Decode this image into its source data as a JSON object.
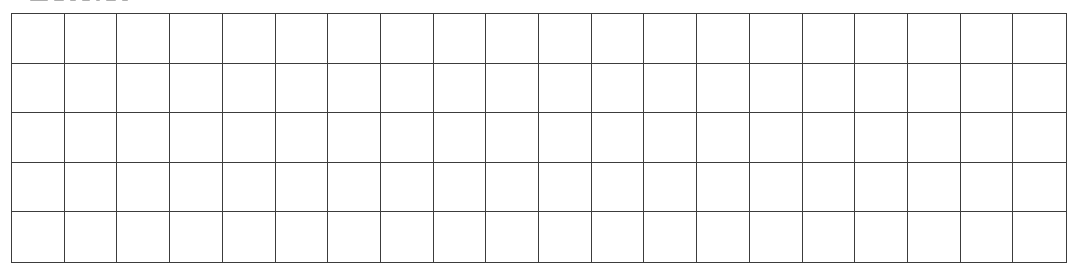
{
  "heading": {
    "text": "",
    "clipped": true,
    "visible_fragment_widths": [
      18,
      10,
      6,
      8,
      4,
      10,
      6
    ]
  },
  "grid": {
    "rows": 5,
    "columns": 20,
    "line_color": "#3c3c3c",
    "background": "#ffffff",
    "cells_filled": 0
  }
}
